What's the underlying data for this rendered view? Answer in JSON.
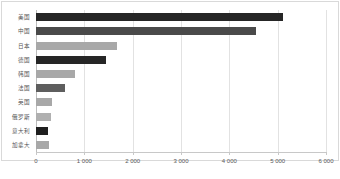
{
  "chart_data": {
    "type": "bar",
    "orientation": "horizontal",
    "title": "",
    "subtitle": "",
    "xlabel": "",
    "ylabel": "",
    "xlim": [
      0,
      6000
    ],
    "ylim": null,
    "grid": true,
    "grid_axis": "x",
    "legend": false,
    "legend_position": "none",
    "categories": [
      "美国",
      "中国",
      "日本",
      "德国",
      "韩国",
      "法国",
      "英国",
      "俄罗斯",
      "意大利",
      "加拿大"
    ],
    "values": [
      5100,
      4550,
      1680,
      1450,
      800,
      610,
      330,
      300,
      250,
      260
    ],
    "bar_colors": [
      "#262626",
      "#4a4a4a",
      "#a8a8a8",
      "#262626",
      "#a8a8a8",
      "#5e5e5e",
      "#a8a8a8",
      "#b0b0b0",
      "#1f1f1f",
      "#a8a8a8"
    ],
    "xticks": [
      0,
      1000,
      2000,
      3000,
      4000,
      5000,
      6000
    ],
    "xticklabels": [
      "0",
      "1 000",
      "2 000",
      "3 000",
      "4 000",
      "5 000",
      "6 000"
    ],
    "annotations": []
  },
  "style": {
    "background": "#ffffff",
    "frame_color": "#d9d9d9",
    "gridline_color": "#e2e2e2",
    "axis_color": "#c8c8c8",
    "tick_label_color": "#585858",
    "category_label_color": "#555555"
  }
}
